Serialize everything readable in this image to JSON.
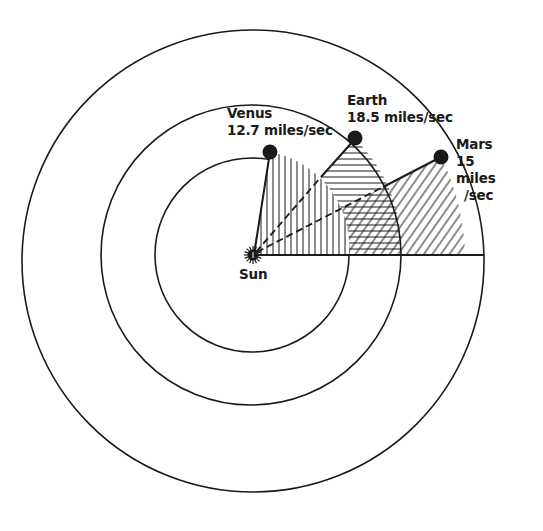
{
  "diagram": {
    "title": "",
    "colors": {
      "ink": "#1a1a1a",
      "background": "#ffffff"
    },
    "center": {
      "label": "Sun"
    },
    "orbits": [
      {
        "name": "Venus orbit",
        "order": 1
      },
      {
        "name": "Earth orbit",
        "order": 2
      },
      {
        "name": "Mars orbit",
        "order": 3
      }
    ],
    "planets": [
      {
        "name": "Venus",
        "speed": "12.7 miles/sec",
        "hatch": "vertical"
      },
      {
        "name": "Earth",
        "speed": "18.5 miles/sec",
        "hatch": "horizontal"
      },
      {
        "name": "Mars",
        "speed_lines": [
          "15",
          "miles",
          "/sec"
        ],
        "hatch": "diagonal"
      }
    ]
  }
}
